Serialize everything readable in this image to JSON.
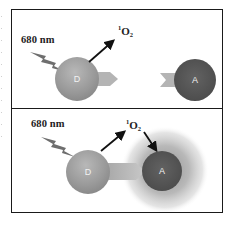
{
  "figure": {
    "panels": [
      {
        "id": "top",
        "wavelength_label": "680 nm",
        "singlet_oxygen_label": {
          "sup": "1",
          "base": "O",
          "sub": "2"
        },
        "donor_label": "D",
        "acceptor_label": "A",
        "state": "separated"
      },
      {
        "id": "bottom",
        "wavelength_label": "680 nm",
        "singlet_oxygen_label": {
          "sup": "1",
          "base": "O",
          "sub": "2"
        },
        "donor_label": "D",
        "acceptor_label": "A",
        "state": "docked"
      }
    ],
    "colors": {
      "frame": "#1a1a1a",
      "donor": "#9a9a9a",
      "acceptor": "#555555",
      "donor_arrow": "#b0b0b0",
      "halo": "#8c8c8c",
      "bolt": "#6e6e6e",
      "arrow": "#111111"
    }
  }
}
